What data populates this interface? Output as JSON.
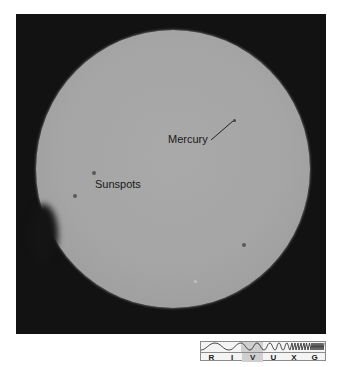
{
  "image": {
    "subject": "Solar disk with transit of Mercury",
    "disk_color": "#a5a5a5",
    "background_color": "#121212"
  },
  "annotations": {
    "mercury_label": "Mercury",
    "sunspots_label": "Sunspots"
  },
  "spectrum_bar": {
    "bands": [
      "R",
      "I",
      "V",
      "U",
      "X",
      "G"
    ],
    "highlighted_band": "V"
  }
}
